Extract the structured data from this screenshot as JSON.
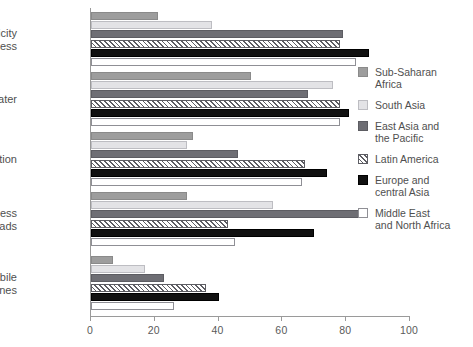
{
  "chart_data": {
    "type": "bar",
    "orientation": "horizontal",
    "title": "",
    "xlabel": "",
    "ylabel": "",
    "xlim": [
      0,
      100
    ],
    "xticks": [
      0,
      20,
      40,
      60,
      80,
      100
    ],
    "xtick_labels": [
      "0",
      "20",
      "40",
      "60",
      "80",
      "100"
    ],
    "grid": false,
    "legend_position": "right",
    "categories": [
      "Electricity\nnetwork access",
      "Potable water",
      "Sanitation",
      "Rural access\nto roads",
      "Fixed and mobile\naccess to phones"
    ],
    "series": [
      {
        "name": "Sub-Saharan\nAfrica",
        "key": "ssa",
        "color": "#9d9d9d",
        "values": [
          21,
          50,
          32,
          30,
          7
        ]
      },
      {
        "name": "South Asia",
        "key": "sa",
        "color": "#e3e3e6",
        "values": [
          38,
          76,
          30,
          57,
          17
        ]
      },
      {
        "name": "East Asia and\nthe Pacific",
        "key": "eap",
        "color": "#6e6e74",
        "values": [
          79,
          68,
          46,
          86,
          23
        ]
      },
      {
        "name": "Latin America",
        "key": "la",
        "color": "#5d5d63",
        "values": [
          78,
          78,
          67,
          43,
          36
        ]
      },
      {
        "name": "Europe and\ncentral Asia",
        "key": "eca",
        "color": "#111111",
        "values": [
          87,
          81,
          74,
          70,
          40
        ]
      },
      {
        "name": "Middle East\nand North Africa",
        "key": "mena",
        "color": "#ffffff",
        "values": [
          83,
          78,
          66,
          45,
          26
        ]
      }
    ]
  },
  "legend": {
    "items": [
      {
        "label": "Sub-Saharan\nAfrica",
        "swatch": "legend-swatch-sub-saharan-africa"
      },
      {
        "label": "South Asia",
        "swatch": "legend-swatch-south-asia"
      },
      {
        "label": "East Asia and\nthe Pacific",
        "swatch": "legend-swatch-east-asia-pacific"
      },
      {
        "label": "Latin America",
        "swatch": "legend-swatch-latin-america"
      },
      {
        "label": "Europe and\ncentral Asia",
        "swatch": "legend-swatch-europe-central-asia"
      },
      {
        "label": "Middle East\nand North Africa",
        "swatch": "legend-swatch-middle-east-north-africa"
      }
    ]
  },
  "axis": {
    "tick_labels": [
      "0",
      "20",
      "40",
      "60",
      "80",
      "100"
    ]
  }
}
